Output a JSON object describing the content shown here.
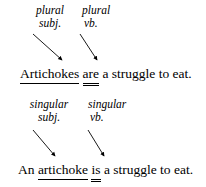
{
  "figure": {
    "name": "subject-verb-agreement-diagram",
    "ink_color": "#000000",
    "background_color": "#ffffff"
  },
  "examples": [
    {
      "id": "plural",
      "subject_label": {
        "line1": "plural",
        "line2": "subj."
      },
      "verb_label": {
        "line1": "plural",
        "line2": "vb."
      },
      "sentence": {
        "before_subject": "",
        "subject": "Artichokes",
        "between": " ",
        "verb": "are",
        "after_verb": " a struggle to eat.",
        "full_text": "Artichokes are a struggle to eat."
      }
    },
    {
      "id": "singular",
      "subject_label": {
        "line1": "singular",
        "line2": "subj."
      },
      "verb_label": {
        "line1": "singular",
        "line2": "vb."
      },
      "sentence": {
        "before_subject": "An ",
        "subject": "artichoke",
        "between": " ",
        "verb": "is",
        "after_verb": " a struggle to eat.",
        "full_text": "An artichoke is a struggle to eat."
      }
    }
  ],
  "legend": {
    "subject_marking": "single underline",
    "verb_marking": "double underline"
  }
}
